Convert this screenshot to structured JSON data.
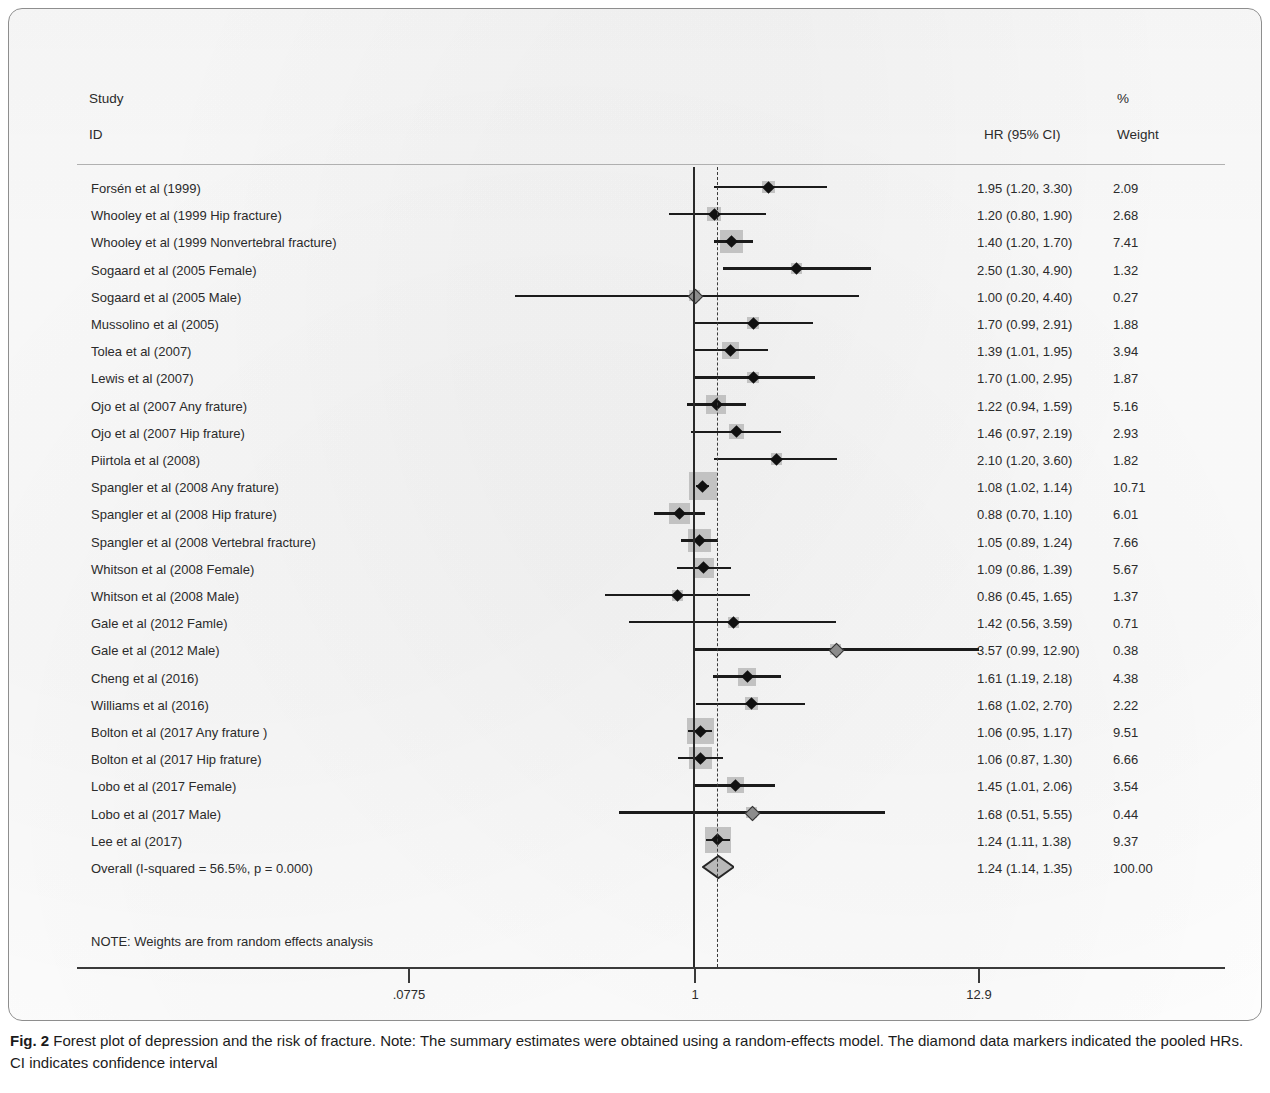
{
  "header": {
    "study": "Study",
    "id": "ID",
    "hr": "HR (95% CI)",
    "pct": "%",
    "weight": "Weight"
  },
  "note": "NOTE: Weights are from random effects analysis",
  "caption": {
    "lead": "Fig. 2",
    "body": " Forest plot of depression and the risk of fracture. Note: The summary estimates were obtained using a random-effects model. The diamond data markers indicated the pooled HRs. CI indicates confidence interval"
  },
  "axis": {
    "ticks": [
      {
        "label": ".0775",
        "value": 0.0775,
        "x": 400
      },
      {
        "label": "1",
        "value": 1,
        "x": 686
      },
      {
        "label": "12.9",
        "value": 12.9,
        "x": 970
      }
    ]
  },
  "colors": {
    "box": "#c2c2c2",
    "marker": "#111111",
    "line": "#1b1b1b",
    "rule": "#9a9a9a",
    "axis": "#3a3a3a"
  },
  "chart_data": {
    "type": "forest",
    "title": "Forest plot of depression and the risk of fracture",
    "xlabel": "HR (95% CI)",
    "ylabel": "",
    "scale": "log",
    "xlim": [
      0.0775,
      12.9
    ],
    "null_value": 1,
    "pooled_value": 1.24,
    "grid": false,
    "columns": [
      "Study ID",
      "HR (95% CI)",
      "% Weight"
    ],
    "heterogeneity": "I-squared = 56.5%, p = 0.000",
    "rows": [
      {
        "label": "Forsén et al (1999)",
        "hr": 1.95,
        "lo": 1.2,
        "hi": 3.3,
        "hr_text": "1.95 (1.20, 3.30)",
        "weight": 2.09,
        "weight_text": "2.09"
      },
      {
        "label": "Whooley et al (1999 Hip fracture)",
        "hr": 1.2,
        "lo": 0.8,
        "hi": 1.9,
        "hr_text": "1.20 (0.80, 1.90)",
        "weight": 2.68,
        "weight_text": "2.68"
      },
      {
        "label": "Whooley et al (1999 Nonvertebral fracture)",
        "hr": 1.4,
        "lo": 1.2,
        "hi": 1.7,
        "hr_text": "1.40 (1.20, 1.70)",
        "weight": 7.41,
        "weight_text": "7.41"
      },
      {
        "label": "Sogaard et al (2005 Female)",
        "hr": 2.5,
        "lo": 1.3,
        "hi": 4.9,
        "hr_text": "2.50 (1.30, 4.90)",
        "weight": 1.32,
        "weight_text": "1.32"
      },
      {
        "label": "Sogaard et al (2005 Male)",
        "hr": 1.0,
        "lo": 0.2,
        "hi": 4.4,
        "hr_text": "1.00 (0.20, 4.40)",
        "weight": 0.27,
        "weight_text": "0.27"
      },
      {
        "label": "Mussolino et al (2005)",
        "hr": 1.7,
        "lo": 0.99,
        "hi": 2.91,
        "hr_text": "1.70 (0.99, 2.91)",
        "weight": 1.88,
        "weight_text": "1.88"
      },
      {
        "label": "Tolea et al (2007)",
        "hr": 1.39,
        "lo": 1.01,
        "hi": 1.95,
        "hr_text": "1.39 (1.01, 1.95)",
        "weight": 3.94,
        "weight_text": "3.94"
      },
      {
        "label": "Lewis et al (2007)",
        "hr": 1.7,
        "lo": 1.0,
        "hi": 2.95,
        "hr_text": "1.70 (1.00, 2.95)",
        "weight": 1.87,
        "weight_text": "1.87"
      },
      {
        "label": "Ojo et al (2007 Any frature)",
        "hr": 1.22,
        "lo": 0.94,
        "hi": 1.59,
        "hr_text": "1.22 (0.94, 1.59)",
        "weight": 5.16,
        "weight_text": "5.16"
      },
      {
        "label": "Ojo et al (2007 Hip frature)",
        "hr": 1.46,
        "lo": 0.97,
        "hi": 2.19,
        "hr_text": "1.46 (0.97, 2.19)",
        "weight": 2.93,
        "weight_text": "2.93"
      },
      {
        "label": "Piirtola et al (2008)",
        "hr": 2.1,
        "lo": 1.2,
        "hi": 3.6,
        "hr_text": "2.10 (1.20, 3.60)",
        "weight": 1.82,
        "weight_text": "1.82"
      },
      {
        "label": "Spangler et al (2008 Any frature)",
        "hr": 1.08,
        "lo": 1.02,
        "hi": 1.14,
        "hr_text": "1.08 (1.02, 1.14)",
        "weight": 10.71,
        "weight_text": "10.71"
      },
      {
        "label": "Spangler et al (2008 Hip frature)",
        "hr": 0.88,
        "lo": 0.7,
        "hi": 1.1,
        "hr_text": "0.88 (0.70, 1.10)",
        "weight": 6.01,
        "weight_text": "6.01"
      },
      {
        "label": "Spangler et al (2008 Vertebral fracture)",
        "hr": 1.05,
        "lo": 0.89,
        "hi": 1.24,
        "hr_text": "1.05 (0.89, 1.24)",
        "weight": 7.66,
        "weight_text": "7.66"
      },
      {
        "label": "Whitson et al (2008 Female)",
        "hr": 1.09,
        "lo": 0.86,
        "hi": 1.39,
        "hr_text": "1.09 (0.86, 1.39)",
        "weight": 5.67,
        "weight_text": "5.67"
      },
      {
        "label": "Whitson et al (2008 Male)",
        "hr": 0.86,
        "lo": 0.45,
        "hi": 1.65,
        "hr_text": "0.86 (0.45, 1.65)",
        "weight": 1.37,
        "weight_text": "1.37"
      },
      {
        "label": "Gale et al (2012 Famle)",
        "hr": 1.42,
        "lo": 0.56,
        "hi": 3.59,
        "hr_text": "1.42 (0.56, 3.59)",
        "weight": 0.71,
        "weight_text": "0.71"
      },
      {
        "label": "Gale et al (2012 Male)",
        "hr": 3.57,
        "lo": 0.99,
        "hi": 12.9,
        "hr_text": "3.57 (0.99, 12.90)",
        "weight": 0.38,
        "weight_text": "0.38"
      },
      {
        "label": "Cheng et al (2016)",
        "hr": 1.61,
        "lo": 1.19,
        "hi": 2.18,
        "hr_text": "1.61 (1.19, 2.18)",
        "weight": 4.38,
        "weight_text": "4.38"
      },
      {
        "label": "Williams et al (2016)",
        "hr": 1.68,
        "lo": 1.02,
        "hi": 2.7,
        "hr_text": "1.68 (1.02, 2.70)",
        "weight": 2.22,
        "weight_text": "2.22"
      },
      {
        "label": "Bolton et al (2017 Any frature )",
        "hr": 1.06,
        "lo": 0.95,
        "hi": 1.17,
        "hr_text": "1.06 (0.95, 1.17)",
        "weight": 9.51,
        "weight_text": "9.51"
      },
      {
        "label": "Bolton et al (2017 Hip frature)",
        "hr": 1.06,
        "lo": 0.87,
        "hi": 1.3,
        "hr_text": "1.06 (0.87, 1.30)",
        "weight": 6.66,
        "weight_text": "6.66"
      },
      {
        "label": "Lobo et al (2017 Female)",
        "hr": 1.45,
        "lo": 1.01,
        "hi": 2.06,
        "hr_text": "1.45 (1.01, 2.06)",
        "weight": 3.54,
        "weight_text": "3.54"
      },
      {
        "label": "Lobo et al (2017 Male)",
        "hr": 1.68,
        "lo": 0.51,
        "hi": 5.55,
        "hr_text": "1.68 (0.51, 5.55)",
        "weight": 0.44,
        "weight_text": "0.44"
      },
      {
        "label": "Lee et al (2017)",
        "hr": 1.24,
        "lo": 1.11,
        "hi": 1.38,
        "hr_text": "1.24 (1.11, 1.38)",
        "weight": 9.37,
        "weight_text": "9.37"
      },
      {
        "label": "Overall  (I-squared = 56.5%, p = 0.000)",
        "hr": 1.24,
        "lo": 1.14,
        "hi": 1.35,
        "hr_text": "1.24 (1.14, 1.35)",
        "weight": 100.0,
        "weight_text": "100.00",
        "is_overall": true
      }
    ]
  }
}
